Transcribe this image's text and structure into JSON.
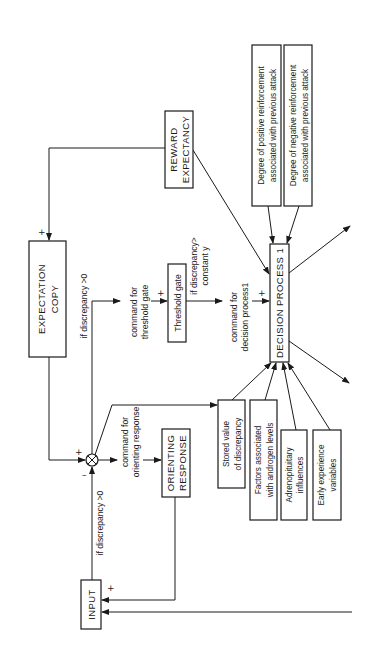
{
  "diagram": {
    "orientation": "rotated 90 degrees counter-clockwise",
    "boxes": {
      "input": "INPUT",
      "expectation_copy": [
        "EXPECTATION",
        "COPY"
      ],
      "reward_expectancy": [
        "REWARD",
        "EXPECTANCY"
      ],
      "threshold_gate": "Threshold gate",
      "orienting_response": [
        "ORIENTING",
        "RESPONSE"
      ],
      "decision_process": "DECISION PROCESS 1",
      "positive_reinforcement": [
        "Degree of positive reinforcement",
        "associated with previous attack"
      ],
      "negative_reinforcement": [
        "Degree of negative reinforcement",
        "associated with previous attack"
      ],
      "stored_value": [
        "Stored value",
        "of discrepancy"
      ],
      "androgen_factors": [
        "Factors associated",
        "with androgen levels"
      ],
      "adrenopituitary": [
        "Adrenopituitary",
        "influences"
      ],
      "early_experience": [
        "Early experience",
        "variables"
      ]
    },
    "labels": {
      "if_discrepancy_upper": "if discrepancy >0",
      "if_discrepancy_lower": "if discrepancy >0",
      "command_threshold": [
        "command for",
        "threshold gate"
      ],
      "if_discrepancy_constant": [
        "if discrepancy>",
        "constant y"
      ],
      "command_decision": [
        "command for",
        "decision process1"
      ],
      "command_orienting": [
        "command for",
        "orienting response"
      ]
    },
    "signs": {
      "plus": "+",
      "minus": "–"
    }
  }
}
